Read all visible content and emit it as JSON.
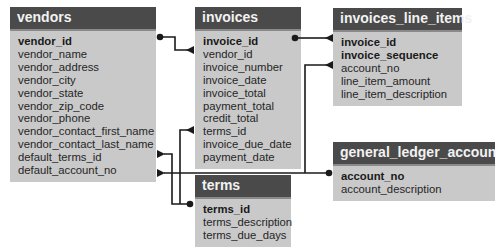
{
  "diagram": {
    "type": "entity-relationship",
    "tables": [
      {
        "id": "vendors",
        "name": "vendors",
        "columns": [
          {
            "name": "vendor_id",
            "key": true
          },
          {
            "name": "vendor_name",
            "key": false
          },
          {
            "name": "vendor_address",
            "key": false
          },
          {
            "name": "vendor_city",
            "key": false
          },
          {
            "name": "vendor_state",
            "key": false
          },
          {
            "name": "vendor_zip_code",
            "key": false
          },
          {
            "name": "vendor_phone",
            "key": false
          },
          {
            "name": "vendor_contact_first_name",
            "key": false
          },
          {
            "name": "vendor_contact_last_name",
            "key": false
          },
          {
            "name": "default_terms_id",
            "key": false
          },
          {
            "name": "default_account_no",
            "key": false
          }
        ]
      },
      {
        "id": "invoices",
        "name": "invoices",
        "columns": [
          {
            "name": "invoice_id",
            "key": true
          },
          {
            "name": "vendor_id",
            "key": false
          },
          {
            "name": "invoice_number",
            "key": false
          },
          {
            "name": "invoice_date",
            "key": false
          },
          {
            "name": "invoice_total",
            "key": false
          },
          {
            "name": "payment_total",
            "key": false
          },
          {
            "name": "credit_total",
            "key": false
          },
          {
            "name": "terms_id",
            "key": false
          },
          {
            "name": "invoice_due_date",
            "key": false
          },
          {
            "name": "payment_date",
            "key": false
          }
        ]
      },
      {
        "id": "invoices_line_items",
        "name": "invoices_line_items",
        "columns": [
          {
            "name": "invoice_id",
            "key": true
          },
          {
            "name": "invoice_sequence",
            "key": true
          },
          {
            "name": "account_no",
            "key": false
          },
          {
            "name": "line_item_amount",
            "key": false
          },
          {
            "name": "line_item_description",
            "key": false
          }
        ]
      },
      {
        "id": "terms",
        "name": "terms",
        "columns": [
          {
            "name": "terms_id",
            "key": true
          },
          {
            "name": "terms_description",
            "key": false
          },
          {
            "name": "terms_due_days",
            "key": false
          }
        ]
      },
      {
        "id": "general_ledger_accounts",
        "name": "general_ledger_accounts",
        "columns": [
          {
            "name": "account_no",
            "key": true
          },
          {
            "name": "account_description",
            "key": false
          }
        ]
      }
    ],
    "relationships": [
      {
        "from": "vendors.vendor_id",
        "to": "invoices.vendor_id",
        "cardinality": "one-to-many"
      },
      {
        "from": "invoices.invoice_id",
        "to": "invoices_line_items.invoice_id",
        "cardinality": "one-to-many"
      },
      {
        "from": "terms.terms_id",
        "to": "invoices.terms_id",
        "cardinality": "one-to-many"
      },
      {
        "from": "terms.terms_id",
        "to": "vendors.default_terms_id",
        "cardinality": "one-to-many"
      },
      {
        "from": "general_ledger_accounts.account_no",
        "to": "vendors.default_account_no",
        "cardinality": "one-to-many"
      },
      {
        "from": "general_ledger_accounts.account_no",
        "to": "invoices_line_items.account_no",
        "cardinality": "one-to-many"
      }
    ]
  },
  "colors": {
    "header_bg": "#4a4a4a",
    "header_text": "#f2f2f2",
    "body_bg": "#c9c9c9",
    "text": "#262626",
    "line": "#1a1a1a"
  }
}
